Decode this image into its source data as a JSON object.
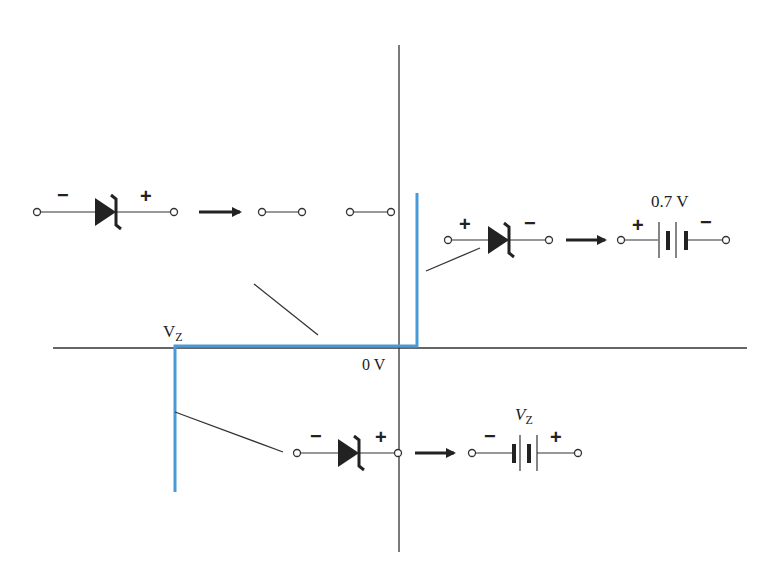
{
  "diagram": {
    "colors": {
      "curve": "#4a9ad8",
      "axis": "#333333",
      "ink": "#222222",
      "background": "#ffffff"
    },
    "axes": {
      "origin_label": "0 V",
      "vz_label_main": "V",
      "vz_label_sub": "Z"
    },
    "regions": {
      "reverse_off": {
        "description": "Region between VZ and 0.7 V: open circuit",
        "diode_left_sign": "−",
        "diode_right_sign": "+",
        "equivalent": "open-circuit"
      },
      "forward": {
        "description": "Forward conduction: 0.7 V battery",
        "diode_left_sign": "+",
        "diode_right_sign": "−",
        "battery_label": "0.7 V",
        "battery_left_sign": "+",
        "battery_right_sign": "−"
      },
      "zener": {
        "description": "Zener breakdown: VZ battery",
        "diode_left_sign": "−",
        "diode_right_sign": "+",
        "battery_label_main": "V",
        "battery_label_sub": "Z",
        "battery_left_sign": "−",
        "battery_right_sign": "+"
      }
    }
  }
}
